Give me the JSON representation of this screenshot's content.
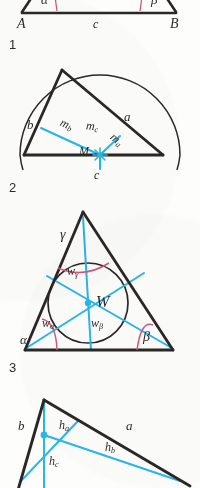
{
  "page": {
    "kind": "geometry-textbook-figures",
    "background_color": "#fdfdfc",
    "ink_color": "#2b2725",
    "construction_color": "#29b6e8",
    "angle_arc_color": "#d2587f"
  },
  "figures": [
    {
      "number": "1",
      "caption_number": "1",
      "topic": "triangle-with-base-angles",
      "labels": {
        "alpha": "α",
        "beta": "β",
        "vertex_a": "A",
        "vertex_b": "B",
        "side_c": "c"
      }
    },
    {
      "number": "2",
      "caption_number": "2",
      "topic": "circumcircle-perpendicular-bisectors",
      "labels": {
        "side_a": "a",
        "side_b": "b",
        "side_c": "c",
        "center": "M",
        "bisector_a": "m",
        "bisector_a_sub": "a",
        "bisector_b": "m",
        "bisector_b_sub": "b",
        "bisector_c": "m",
        "bisector_c_sub": "c"
      }
    },
    {
      "number": "3",
      "caption_number": "3",
      "topic": "incircle-angle-bisectors",
      "labels": {
        "alpha": "α",
        "beta": "β",
        "gamma": "γ",
        "center": "W",
        "bisector_alpha": "w",
        "bisector_alpha_sub": "α",
        "bisector_beta": "w",
        "bisector_beta_sub": "β",
        "bisector_gamma": "w",
        "bisector_gamma_sub": "γ"
      }
    },
    {
      "number": "4",
      "caption_number": "",
      "topic": "altitudes-orthocenter",
      "labels": {
        "side_a": "a",
        "side_b": "b",
        "altitude_a": "h",
        "altitude_a_sub": "a",
        "altitude_b": "h",
        "altitude_b_sub": "b",
        "altitude_c": "h",
        "altitude_c_sub": "c"
      }
    }
  ]
}
